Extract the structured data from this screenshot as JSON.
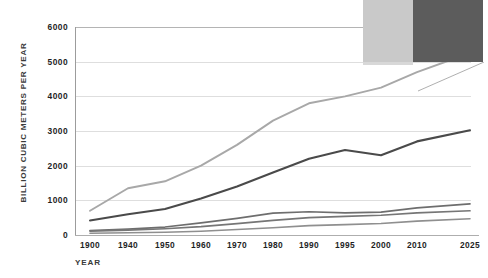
{
  "chart_data": {
    "type": "line",
    "title": "",
    "subtitle": "",
    "xlabel": "YEAR",
    "ylabel": "BILLION CUBIC METERS PER YEAR",
    "categories": [
      "1900",
      "1940",
      "1950",
      "1960",
      "1970",
      "1980",
      "1990",
      "1995",
      "2000",
      "2010",
      "2025"
    ],
    "x_tick_labels": [
      "1900",
      "1940",
      "1950",
      "1960",
      "1970",
      "1980",
      "1990",
      "1995",
      "2000",
      "2010",
      "2025"
    ],
    "y_tick_labels": [
      "6000",
      "5000",
      "4000",
      "3000",
      "2000",
      "1000",
      "0"
    ],
    "y_tick_values": [
      6000,
      5000,
      4000,
      3000,
      2000,
      1000,
      0
    ],
    "ylim": [
      0,
      6000
    ],
    "grid": "horizontal",
    "legend": "none",
    "axis_spines": [
      "left",
      "bottom"
    ],
    "series": [
      {
        "name": "series-1-total-withdrawal",
        "color": "#a8a8a8",
        "width": 1.9,
        "values": [
          700,
          1350,
          1550,
          2000,
          2600,
          3300,
          3800,
          4000,
          4250,
          4700,
          5250
        ]
      },
      {
        "name": "series-2-agricultural",
        "color": "#4a4a4a",
        "width": 2.1,
        "values": [
          420,
          600,
          750,
          1050,
          1400,
          1800,
          2200,
          2450,
          2300,
          2700,
          3020
        ]
      },
      {
        "name": "series-3-industrial",
        "color": "#6e6e6e",
        "width": 1.7,
        "values": [
          130,
          170,
          230,
          350,
          480,
          630,
          670,
          640,
          660,
          780,
          900
        ]
      },
      {
        "name": "series-4-municipal",
        "color": "#767676",
        "width": 1.7,
        "values": [
          110,
          140,
          180,
          240,
          330,
          420,
          500,
          540,
          570,
          640,
          700
        ]
      },
      {
        "name": "series-5-reservoir-losses",
        "color": "#8f8f8f",
        "width": 1.6,
        "values": [
          50,
          65,
          80,
          110,
          160,
          210,
          270,
          300,
          330,
          400,
          470
        ]
      }
    ]
  },
  "inset": {
    "light_swatch_color": "#c9c9c9",
    "dark_swatch_color": "#5c5c5c"
  }
}
